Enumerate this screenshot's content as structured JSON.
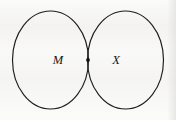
{
  "figure": {
    "type": "venn-diagram",
    "title": "",
    "background_color": "#fbfbfa",
    "stroke_color": "#1d1d1d",
    "sets": [
      {
        "id": "left",
        "label": "M",
        "label_x": 58,
        "label_y": 61,
        "center_x": 50.5,
        "center_y": 60,
        "radius_x": 38,
        "radius_y": 49
      },
      {
        "id": "right",
        "label": "X",
        "label_x": 116,
        "label_y": 61,
        "center_x": 125.5,
        "center_y": 60,
        "radius_x": 38,
        "radius_y": 49
      }
    ],
    "markers": [
      {
        "id": "intersection-element",
        "name": "element-dot",
        "x": 88,
        "y": 60,
        "radius": 1.9,
        "region": "intersection"
      }
    ]
  }
}
